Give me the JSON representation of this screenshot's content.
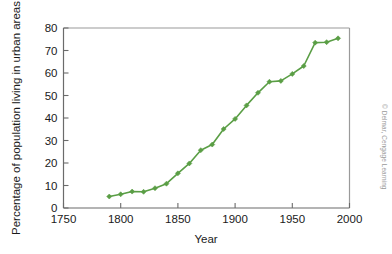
{
  "credit": "© Delmar, Cengage Learning",
  "chart_data": {
    "type": "line",
    "title": "",
    "xlabel": "Year",
    "ylabel": "Percentage of population living in urban areas",
    "xlim": [
      1750,
      2000
    ],
    "ylim": [
      0,
      80
    ],
    "xticks": [
      1750,
      1800,
      1850,
      1900,
      1950,
      2000
    ],
    "xtick_labels": [
      "1750",
      "1800",
      "1850",
      "1900",
      "1950",
      "2000"
    ],
    "yticks": [
      0,
      10,
      20,
      30,
      40,
      50,
      60,
      70,
      80
    ],
    "ytick_labels": [
      "0",
      "10",
      "20",
      "30",
      "40",
      "50",
      "60",
      "70",
      "80"
    ],
    "grid": false,
    "legend": false,
    "legend_position": "none",
    "line_color": "#5a9e45",
    "marker": "diamond",
    "marker_color": "#5a9e45",
    "x": [
      1790,
      1800,
      1810,
      1820,
      1830,
      1840,
      1850,
      1860,
      1870,
      1880,
      1890,
      1900,
      1910,
      1920,
      1930,
      1940,
      1950,
      1960,
      1970,
      1980,
      1990
    ],
    "values": [
      5.1,
      6.1,
      7.3,
      7.2,
      8.8,
      10.8,
      15.4,
      19.8,
      25.7,
      28.2,
      35.1,
      39.6,
      45.6,
      51.2,
      56.1,
      56.5,
      59.6,
      63.1,
      73.5,
      73.7,
      75.4
    ],
    "series": [
      {
        "name": "Percentage of population living in urban areas",
        "x": [
          1790,
          1800,
          1810,
          1820,
          1830,
          1840,
          1850,
          1860,
          1870,
          1880,
          1890,
          1900,
          1910,
          1920,
          1930,
          1940,
          1950,
          1960,
          1970,
          1980,
          1990
        ],
        "values": [
          5.1,
          6.1,
          7.3,
          7.2,
          8.8,
          10.8,
          15.4,
          19.8,
          25.7,
          28.2,
          35.1,
          39.6,
          45.6,
          51.2,
          56.1,
          56.5,
          59.6,
          63.1,
          73.5,
          73.7,
          75.4
        ]
      }
    ]
  }
}
